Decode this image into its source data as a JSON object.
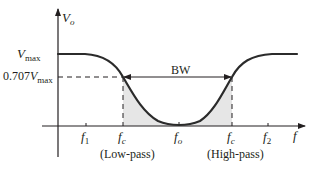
{
  "diagram": {
    "type": "band-stop filter frequency response",
    "y_axis": {
      "label_main": "V",
      "label_sub": "o"
    },
    "x_axis": {
      "label": "f"
    },
    "levels": {
      "vmax": {
        "main": "V",
        "sub": "max"
      },
      "v707": {
        "prefix": "0.707",
        "main": "V",
        "sub": "max"
      }
    },
    "ticks": {
      "f1": {
        "main": "f",
        "sub": "1"
      },
      "fc_low": {
        "main": "f",
        "sub": "c"
      },
      "fo": {
        "main": "f",
        "sub": "o"
      },
      "fc_high": {
        "main": "f",
        "sub": "c"
      },
      "f2": {
        "main": "f",
        "sub": "2"
      }
    },
    "bandwidth_label": "BW",
    "region_labels": {
      "low": "(Low-pass)",
      "high": "(High-pass)"
    },
    "colors": {
      "curve": "#2b2b2b",
      "axis": "#231f20",
      "fill": "#e6e6e6",
      "dashed": "#231f20"
    }
  }
}
